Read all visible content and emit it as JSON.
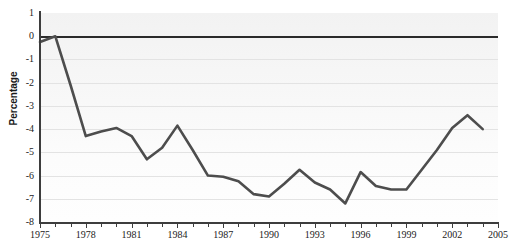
{
  "chart_data": {
    "type": "line",
    "title": "",
    "subtitle": "",
    "xlabel": "",
    "ylabel": "Percentage",
    "xlim": [
      1975,
      2005
    ],
    "ylim": [
      -8,
      1
    ],
    "grid": true,
    "legend": false,
    "legend_position": "none",
    "x_tick_labels": [
      "1975",
      "1978",
      "1981",
      "1984",
      "1987",
      "1990",
      "1993",
      "1996",
      "1999",
      "2002",
      "2005"
    ],
    "x_tick_step": 1,
    "x_label_step": 3,
    "y_tick_labels": [
      "1",
      "0",
      "-1",
      "-2",
      "-3",
      "-4",
      "-5",
      "-6",
      "-7",
      "-8"
    ],
    "y_tick_values": [
      1,
      0,
      -1,
      -2,
      -3,
      -4,
      -5,
      -6,
      -7,
      -8
    ],
    "series": [
      {
        "name": "Percentage",
        "color": "#4d4d4d",
        "line_width": 2.6,
        "x": [
          1975,
          1976,
          1977,
          1978,
          1979,
          1980,
          1981,
          1982,
          1983,
          1984,
          1985,
          1986,
          1987,
          1988,
          1989,
          1990,
          1991,
          1992,
          1993,
          1994,
          1995,
          1996,
          1997,
          1998,
          1999,
          2000,
          2001,
          2002,
          2003,
          2004
        ],
        "values": [
          -0.25,
          0.0,
          -2.1,
          -4.3,
          -4.1,
          -3.95,
          -4.3,
          -5.3,
          -4.8,
          -3.85,
          -4.9,
          -6.0,
          -6.05,
          -6.25,
          -6.8,
          -6.9,
          -6.35,
          -5.75,
          -6.3,
          -6.6,
          -7.2,
          -5.85,
          -6.45,
          -6.6,
          -6.6,
          -5.75,
          -4.9,
          -3.95,
          -3.4,
          -4.0
        ]
      }
    ],
    "zero_line": {
      "value": 0,
      "color": "#2b2b2b",
      "visible": true
    }
  }
}
